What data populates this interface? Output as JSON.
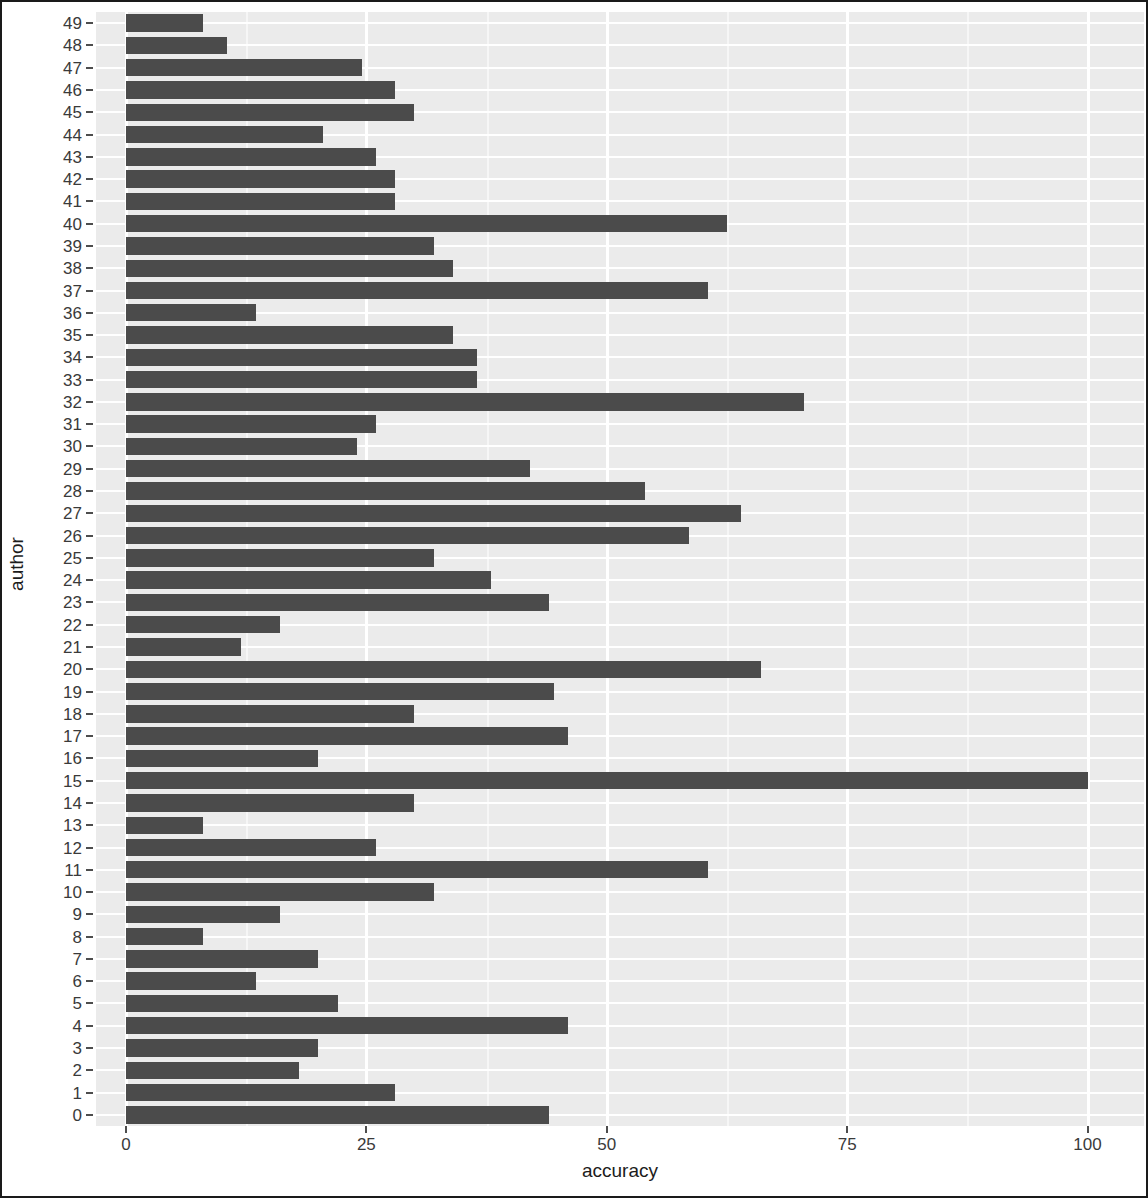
{
  "chart_data": {
    "type": "bar",
    "orientation": "horizontal",
    "title": "",
    "subtitle": "",
    "xlabel": "accuracy",
    "ylabel": "author",
    "xlim": [
      0,
      104
    ],
    "xticks": [
      0,
      25,
      50,
      75,
      100
    ],
    "xtick_labels": [
      "0",
      "25",
      "50",
      "75",
      "100"
    ],
    "grid": true,
    "grid_color": "#ffffff",
    "panel_background": "#ebebeb",
    "bar_color": "#4b4b4b",
    "legend": null,
    "legend_position": "none",
    "categories": [
      "49",
      "48",
      "47",
      "46",
      "45",
      "44",
      "43",
      "42",
      "41",
      "40",
      "39",
      "38",
      "37",
      "36",
      "35",
      "34",
      "33",
      "32",
      "31",
      "30",
      "29",
      "28",
      "27",
      "26",
      "25",
      "24",
      "23",
      "22",
      "21",
      "20",
      "19",
      "18",
      "17",
      "16",
      "15",
      "14",
      "13",
      "12",
      "11",
      "10",
      "9",
      "8",
      "7",
      "6",
      "5",
      "4",
      "3",
      "2",
      "1",
      "0"
    ],
    "values": [
      8,
      10.5,
      24.5,
      28,
      30,
      20.5,
      26,
      28,
      28,
      62.5,
      32,
      34,
      60.5,
      13.5,
      34,
      36.5,
      36.5,
      70.5,
      26,
      24,
      42,
      54,
      64,
      58.5,
      32,
      38,
      44,
      16,
      12,
      66,
      44.5,
      30,
      46,
      20,
      100,
      30,
      8,
      26,
      60.5,
      32,
      16,
      8,
      20,
      13.5,
      22,
      46,
      20,
      18,
      28,
      44
    ]
  },
  "axes": {
    "x_title": "accuracy",
    "y_title": "author"
  }
}
